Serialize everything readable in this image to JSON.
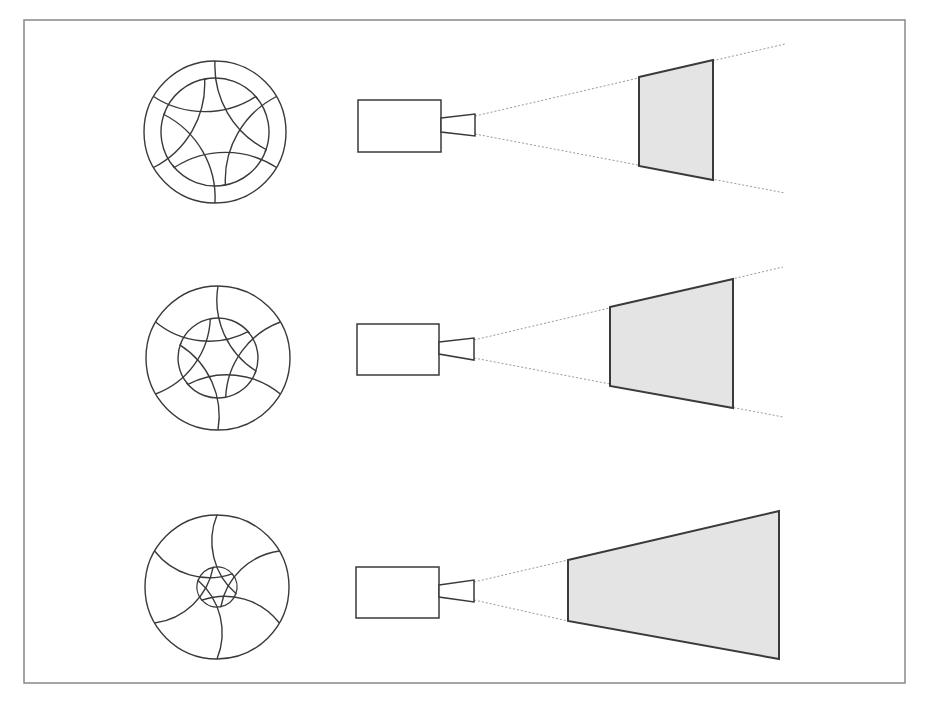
{
  "diagram": {
    "title": "",
    "colors": {
      "stroke": "#3a3a3a",
      "frame": "#888888",
      "fill": "#e4e4e4",
      "dotted": "#999999",
      "background": "#ffffff"
    },
    "frame": {
      "x": 24,
      "y": 20,
      "w": 881,
      "h": 663
    },
    "rows": [
      {
        "name": "row-1",
        "aperture": {
          "cx": 215,
          "cy": 132,
          "r": 71,
          "opening_r": 54,
          "blades": 6
        },
        "camera": {
          "body": [
            358,
            100,
            83,
            52
          ],
          "lens": [
            [
              441,
              118
            ],
            [
              475,
              114
            ],
            [
              475,
              136
            ],
            [
              441,
              132
            ]
          ]
        },
        "beam": {
          "origin_top": [
            475,
            116
          ],
          "origin_bottom": [
            475,
            134
          ],
          "end_top": [
            785,
            44
          ],
          "end_bottom": [
            785,
            193
          ]
        },
        "screen": [
          [
            639,
            77
          ],
          [
            713,
            60
          ],
          [
            713,
            180
          ],
          [
            639,
            166
          ]
        ]
      },
      {
        "name": "row-2",
        "aperture": {
          "cx": 218,
          "cy": 358,
          "r": 72,
          "opening_r": 40,
          "blades": 6
        },
        "camera": {
          "body": [
            357,
            324,
            82,
            51
          ],
          "lens": [
            [
              439,
              342
            ],
            [
              474,
              338
            ],
            [
              474,
              360
            ],
            [
              439,
              354
            ]
          ]
        },
        "beam": {
          "origin_top": [
            474,
            340
          ],
          "origin_bottom": [
            474,
            358
          ],
          "end_top": [
            783,
            267
          ],
          "end_bottom": [
            783,
            417
          ]
        },
        "screen": [
          [
            610,
            307
          ],
          [
            733,
            279
          ],
          [
            733,
            408
          ],
          [
            610,
            386
          ]
        ]
      },
      {
        "name": "row-3",
        "aperture": {
          "cx": 217,
          "cy": 587,
          "r": 72,
          "opening_r": 20,
          "blades": 6
        },
        "camera": {
          "body": [
            356,
            567,
            83,
            51
          ],
          "lens": [
            [
              439,
              585
            ],
            [
              474,
              580
            ],
            [
              474,
              602
            ],
            [
              439,
              597
            ]
          ]
        },
        "beam": {
          "origin_top": [
            474,
            582
          ],
          "origin_bottom": [
            474,
            600
          ],
          "end_top": [
            568,
            560
          ],
          "end_bottom": [
            568,
            621
          ]
        },
        "screen": [
          [
            568,
            560
          ],
          [
            779,
            511
          ],
          [
            779,
            659
          ],
          [
            568,
            621
          ]
        ]
      }
    ]
  }
}
